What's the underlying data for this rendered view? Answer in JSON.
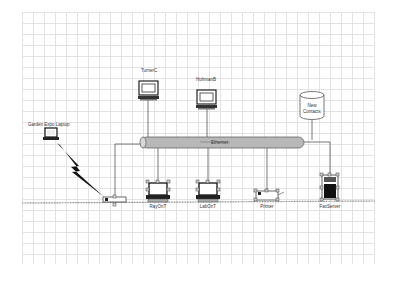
{
  "diagram": {
    "type": "network",
    "backbone": {
      "label": "Ethernet",
      "color": "#b5b5b5"
    },
    "nodes": {
      "laptop": {
        "label": "Garden Expo Laptop",
        "kind": "laptop"
      },
      "turner": {
        "label": "TurnerC",
        "kind": "workstation"
      },
      "hohman": {
        "label": "HohmanB",
        "kind": "workstation"
      },
      "database": {
        "label_line1": "New",
        "label_line2": "Contacts",
        "kind": "database"
      },
      "wireless_ap": {
        "label": "",
        "kind": "wireless-access-point"
      },
      "pc1": {
        "label": "RayOnT",
        "kind": "pc"
      },
      "pc2": {
        "label": "LabOnT",
        "kind": "pc"
      },
      "printer": {
        "label": "Printer",
        "kind": "printer"
      },
      "server": {
        "label": "FaxServer",
        "kind": "server"
      }
    },
    "links": [
      {
        "from": "laptop",
        "to": "wireless_ap",
        "style": "lightning-bolt"
      },
      {
        "from": "turner",
        "to": "backbone"
      },
      {
        "from": "hohman",
        "to": "backbone"
      },
      {
        "from": "database",
        "to": "backbone"
      },
      {
        "from": "backbone",
        "to": "wireless_ap"
      },
      {
        "from": "backbone",
        "to": "pc1"
      },
      {
        "from": "backbone",
        "to": "pc2"
      },
      {
        "from": "backbone",
        "to": "printer"
      },
      {
        "from": "backbone",
        "to": "server"
      }
    ],
    "baseline": {
      "style": "dotted",
      "color": "#888888"
    }
  }
}
